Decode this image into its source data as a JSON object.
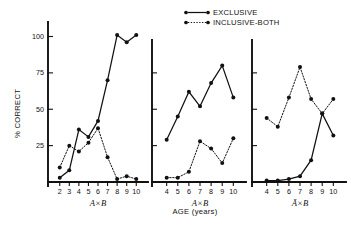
{
  "figure": {
    "ylabel": "% CORRECT",
    "xlabel": "AGE (years)",
    "y_ticks": [
      25,
      50,
      75,
      100
    ],
    "y_tick_labels": [
      "25",
      "50",
      "75",
      "100"
    ],
    "ylim": [
      0,
      112
    ],
    "legend": [
      {
        "label": "EXCLUSIVE",
        "style": "solid",
        "marker": "filled-circle"
      },
      {
        "label": "INCLUSIVE-BOTH",
        "style": "dotted",
        "marker": "filled-circle"
      }
    ]
  },
  "chart_data": [
    {
      "type": "line",
      "panel": 1,
      "title": "A×B",
      "xlabel": "AGE (years)",
      "ylabel": "% CORRECT",
      "x": [
        2,
        3,
        4,
        5,
        6,
        7,
        8,
        9,
        10
      ],
      "xlim": [
        1.4,
        10.6
      ],
      "ylim": [
        0,
        112
      ],
      "x_tick_labels": [
        "2",
        "3",
        "4",
        "5",
        "6",
        "7",
        "8",
        "9",
        "10"
      ],
      "grid": false,
      "legend_position": "top-center",
      "series": [
        {
          "name": "EXCLUSIVE",
          "style": "solid",
          "x": [
            2,
            3,
            4,
            5,
            6,
            7,
            8,
            9,
            10
          ],
          "values": [
            3,
            8,
            36,
            31,
            42,
            70,
            101,
            96,
            101
          ]
        },
        {
          "name": "INCLUSIVE-BOTH",
          "style": "dotted",
          "x": [
            2,
            3,
            4,
            5,
            6,
            7,
            8,
            9,
            10
          ],
          "values": [
            10,
            25,
            21,
            27,
            37,
            17,
            2,
            4,
            2
          ]
        }
      ]
    },
    {
      "type": "line",
      "panel": 2,
      "title": "A×B",
      "xlabel": "AGE (years)",
      "ylabel": "% CORRECT",
      "x": [
        4,
        5,
        6,
        7,
        8,
        9,
        10
      ],
      "xlim": [
        3.4,
        10.6
      ],
      "ylim": [
        0,
        112
      ],
      "x_tick_labels": [
        "4",
        "5",
        "6",
        "7",
        "8",
        "9",
        "10"
      ],
      "grid": false,
      "series": [
        {
          "name": "EXCLUSIVE",
          "style": "solid",
          "x": [
            4,
            5,
            6,
            7,
            8,
            9,
            10
          ],
          "values": [
            29,
            45,
            62,
            52,
            68,
            80,
            58
          ]
        },
        {
          "name": "INCLUSIVE-BOTH",
          "style": "dotted",
          "x": [
            4,
            5,
            6,
            7,
            8,
            9,
            10
          ],
          "values": [
            3,
            3,
            7,
            28,
            23,
            13,
            30
          ]
        }
      ]
    },
    {
      "type": "line",
      "panel": 3,
      "title": "Ā×B",
      "xlabel": "AGE (years)",
      "ylabel": "% CORRECT",
      "x": [
        4,
        5,
        6,
        7,
        8,
        9,
        10
      ],
      "xlim": [
        3.4,
        10.6
      ],
      "ylim": [
        0,
        112
      ],
      "x_tick_labels": [
        "4",
        "5",
        "6",
        "7",
        "8",
        "9",
        "10"
      ],
      "grid": false,
      "series": [
        {
          "name": "EXCLUSIVE",
          "style": "solid",
          "x": [
            4,
            5,
            6,
            7,
            8,
            9,
            10
          ],
          "values": [
            1,
            1,
            2,
            4,
            15,
            47,
            32
          ]
        },
        {
          "name": "INCLUSIVE-BOTH",
          "style": "dotted",
          "x": [
            4,
            5,
            6,
            7,
            8,
            9,
            10
          ],
          "values": [
            44,
            38,
            58,
            79,
            57,
            47,
            57
          ]
        }
      ]
    }
  ]
}
